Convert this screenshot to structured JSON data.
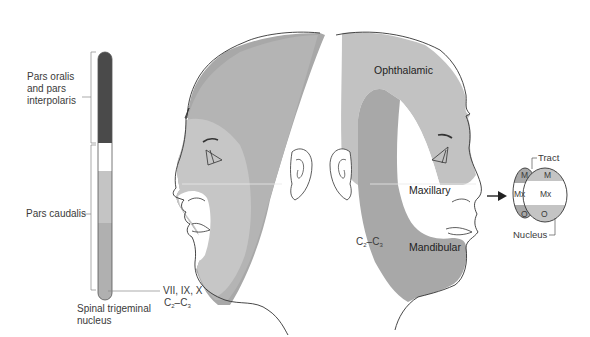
{
  "column": {
    "labels": {
      "oralis": [
        "Pars oralis",
        "and pars",
        "interpolaris"
      ],
      "caudalis": "Pars caudalis",
      "nerves": "VII, IX, X",
      "cervical": {
        "c": "C",
        "sub1": "2",
        "dash": "–C",
        "sub2": "3"
      },
      "title": [
        "Spinal trigeminal",
        "nucleus"
      ]
    },
    "colors": {
      "oralis": "#4a4a4a",
      "gap": "#ffffff",
      "caudalis_upper": "#c4c4c4",
      "caudalis_lower": "#b0b0b0"
    }
  },
  "right_face": {
    "labels": {
      "ophthalamic": "Ophthalamic",
      "maxillary": "Maxillary",
      "mandibular": "Mandibular",
      "cervical": {
        "c": "C",
        "sub1": "2",
        "dash": "–C",
        "sub2": "3"
      }
    },
    "colors": {
      "ophthalamic": "#c2c2c2",
      "maxillary": "#ffffff",
      "mandibular": "#a8a8a8"
    }
  },
  "left_face": {
    "colors": {
      "outer": "#a8a8a8",
      "middle": "#b4b4b4",
      "inner": "#c6c6c6",
      "innermost": "#ffffff"
    }
  },
  "section_diagram": {
    "labels": {
      "tract": "Tract",
      "nucleus": "Nucleus",
      "m_left": "M",
      "m_right": "M",
      "mx_left": "Mx",
      "mx_right": "Mx",
      "o_left": "O",
      "o_right": "O"
    }
  }
}
